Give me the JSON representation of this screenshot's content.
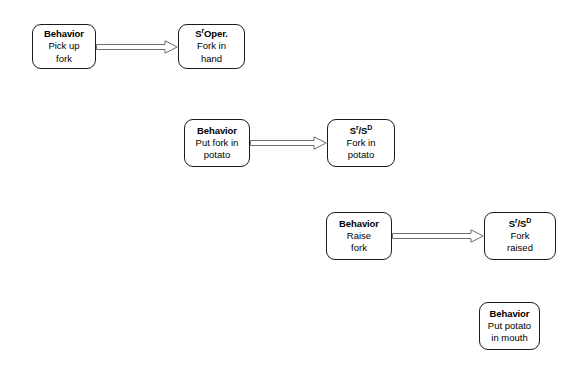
{
  "diagram": {
    "type": "behavior-chain-flowchart",
    "background_color": "#ffffff",
    "border_color": "#1a1a1a",
    "arrow_color": "#6e6e6e",
    "text_color": "#000000",
    "nodes": [
      {
        "id": "behavior-pick-up-fork",
        "role": "behavior",
        "title": "Behavior",
        "title_html": "Behavior",
        "lines": [
          "Pick up",
          "fork"
        ],
        "x": 32,
        "y": 24,
        "w": 64,
        "h": 45
      },
      {
        "id": "consequence-fork-in-hand",
        "role": "consequence",
        "title": "SrOper.",
        "title_html": "S<sup>r</sup>Oper.",
        "lines": [
          "Fork in",
          "hand"
        ],
        "x": 178,
        "y": 24,
        "w": 67,
        "h": 45
      },
      {
        "id": "behavior-put-fork-in-potato",
        "role": "behavior",
        "title": "Behavior",
        "title_html": "Behavior",
        "lines": [
          "Put fork in",
          "potato"
        ],
        "x": 184,
        "y": 119,
        "w": 66,
        "h": 48
      },
      {
        "id": "consequence-fork-in-potato",
        "role": "consequence",
        "title": "Sr/SD",
        "title_html": "S<sup>r</sup>/S<sup>D</sup>",
        "lines": [
          "Fork in",
          "potato"
        ],
        "x": 327,
        "y": 119,
        "w": 68,
        "h": 48
      },
      {
        "id": "behavior-raise-fork",
        "role": "behavior",
        "title": "Behavior",
        "title_html": "Behavior",
        "lines": [
          "Raise",
          "fork"
        ],
        "x": 326,
        "y": 212,
        "w": 66,
        "h": 48
      },
      {
        "id": "consequence-fork-raised",
        "role": "consequence",
        "title": "Sr/SD",
        "title_html": "S<sup>r</sup>/S<sup>D</sup>",
        "lines": [
          "Fork",
          "raised"
        ],
        "x": 484,
        "y": 212,
        "w": 72,
        "h": 48
      },
      {
        "id": "behavior-put-potato-in-mouth",
        "role": "behavior",
        "title": "Behavior",
        "title_html": "Behavior",
        "lines": [
          "Put potato",
          "in mouth"
        ],
        "x": 479,
        "y": 302,
        "w": 61,
        "h": 48
      }
    ],
    "arrows": [
      {
        "id": "arrow-1",
        "from": "behavior-pick-up-fork",
        "to": "consequence-fork-in-hand",
        "x": 96,
        "y": 40,
        "length": 82,
        "style": "open-outline"
      },
      {
        "id": "arrow-2",
        "from": "behavior-put-fork-in-potato",
        "to": "consequence-fork-in-potato",
        "x": 250,
        "y": 136,
        "length": 77,
        "style": "open-outline"
      },
      {
        "id": "arrow-3",
        "from": "behavior-raise-fork",
        "to": "consequence-fork-raised",
        "x": 392,
        "y": 229,
        "length": 92,
        "style": "open-outline"
      }
    ]
  }
}
